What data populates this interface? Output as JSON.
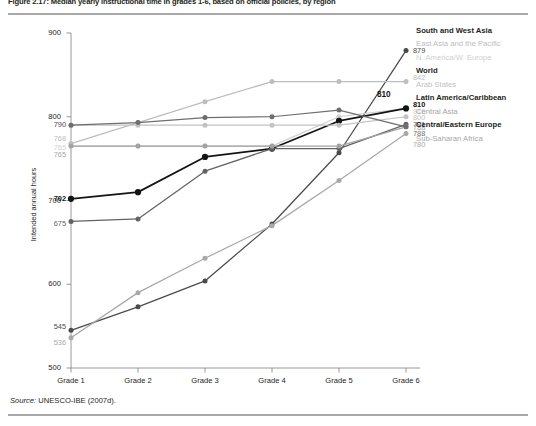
{
  "figure": {
    "title": "Figure 2.17: Median yearly instructional time in grades 1-6, based on official policies, by region",
    "source_prefix": "Source:",
    "source_text": "UNESCO-IBE (2007d)."
  },
  "chart_data": {
    "type": "line",
    "title": "Figure 2.17: Median yearly instructional time in grades 1-6, based on official policies, by region",
    "xlabel": "",
    "ylabel": "Intended annual hours",
    "categories": [
      "Grade 1",
      "Grade 2",
      "Grade 3",
      "Grade 4",
      "Grade 5",
      "Grade 6"
    ],
    "ylim": [
      500,
      900
    ],
    "yticks": [
      500,
      600,
      700,
      800,
      900
    ],
    "grid": false,
    "legend_position": "right",
    "series": [
      {
        "name": "South and West Asia",
        "color": "#4a4a4a",
        "values": [
          545,
          573,
          604,
          672,
          757,
          879
        ],
        "start_label": "545",
        "end_label": "879"
      },
      {
        "name": "East Asia and the Pacific",
        "color": "#bdbdbd",
        "values": [
          768,
          793,
          818,
          842,
          842,
          842
        ],
        "start_label": "768",
        "end_label": "842"
      },
      {
        "name": "N. America/W. Europe",
        "color": "#cfcfcf",
        "values": [
          765,
          765,
          765,
          765,
          800,
          810
        ],
        "start_label": "765",
        "end_label": "810"
      },
      {
        "name": "World",
        "color": "#141414",
        "values": [
          702,
          710,
          752,
          762,
          795,
          810
        ],
        "start_label": "702",
        "end_label": "810",
        "highlight_label": "810"
      },
      {
        "name": "Arab States",
        "color": "#c2c2c2",
        "values": [
          790,
          790,
          790,
          790,
          790,
          800
        ],
        "start_label": "790",
        "end_label": "800"
      },
      {
        "name": "Latin America/Caribbean",
        "color": "#636363",
        "values": [
          675,
          678,
          735,
          762,
          762,
          791
        ],
        "start_label": "675",
        "end_label": "791"
      },
      {
        "name": "Central Asia",
        "color": "#a3a3a3",
        "values": [
          765,
          765,
          765,
          765,
          765,
          788
        ],
        "start_label": "765",
        "end_label": "788"
      },
      {
        "name": "Central/Eastern Europe",
        "color": "#6e6e6e",
        "values": [
          790,
          793,
          799,
          800,
          808,
          788
        ],
        "start_label": "790",
        "end_label": "788"
      },
      {
        "name": "Sub-Saharan Africa",
        "color": "#a8a8a8",
        "values": [
          536,
          590,
          631,
          670,
          724,
          780
        ],
        "start_label": "536",
        "end_label": "780"
      }
    ]
  }
}
